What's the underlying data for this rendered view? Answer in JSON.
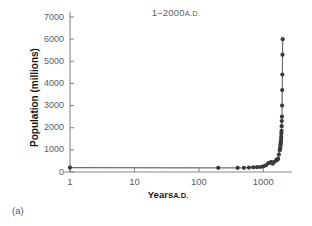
{
  "figure": {
    "panel_caption": "(a)",
    "background_color": "#ffffff"
  },
  "chart_data": {
    "type": "scatter",
    "title_main": "1–2000",
    "title_suffix": "A.D.",
    "xlabel": "Years A.D.",
    "xlabel_main": "Years",
    "xlabel_suffix": "A.D.",
    "ylabel": "Population (millions)",
    "xscale": "log",
    "yscale": "linear",
    "xlim": [
      1,
      2600
    ],
    "ylim": [
      0,
      7000
    ],
    "grid": false,
    "legend": null,
    "marker_color": "#3a3a3a",
    "line_color": "#6e6e6e",
    "axis_color": "#8a8a8a",
    "xticks": [
      1,
      10,
      100,
      1000
    ],
    "xtick_labels": [
      "1",
      "10",
      "100",
      "1000"
    ],
    "yticks": [
      0,
      1000,
      2000,
      3000,
      4000,
      5000,
      6000,
      7000
    ],
    "ytick_labels": [
      "0",
      "1000",
      "2000",
      "3000",
      "4000",
      "5000",
      "6000",
      "7000"
    ],
    "series": [
      {
        "name": "World population",
        "x": [
          1,
          200,
          400,
          500,
          600,
          700,
          800,
          900,
          1000,
          1100,
          1200,
          1300,
          1340,
          1400,
          1500,
          1600,
          1650,
          1700,
          1750,
          1800,
          1820,
          1840,
          1850,
          1860,
          1870,
          1880,
          1890,
          1900,
          1910,
          1920,
          1930,
          1940,
          1950,
          1960,
          1970,
          1980,
          1990,
          2000
        ],
        "y": [
          200,
          190,
          190,
          190,
          200,
          210,
          220,
          226,
          254,
          301,
          400,
          432,
          442,
          375,
          461,
          554,
          545,
          603,
          791,
          978,
          1042,
          1100,
          1200,
          1270,
          1330,
          1400,
          1490,
          1600,
          1750,
          1860,
          2070,
          2300,
          2500,
          3000,
          3700,
          4400,
          5300,
          6000
        ],
        "marker": "circle",
        "marker_size": 4.2
      }
    ]
  }
}
